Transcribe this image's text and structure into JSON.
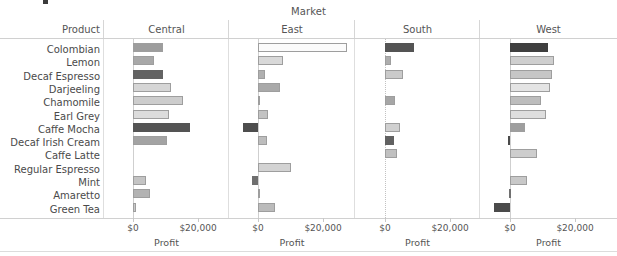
{
  "chart_data": {
    "type": "bar",
    "title": "Market",
    "row_field": "Product",
    "column_field": "Market",
    "xlabel": "Profit",
    "ylabel": "Product",
    "orientation": "horizontal",
    "grid": false,
    "legend": "none",
    "xlim": [
      -8000,
      30000
    ],
    "xticks": [
      0,
      20000
    ],
    "xticklabels": [
      "$0",
      "$20,000"
    ],
    "categories": [
      "Colombian",
      "Lemon",
      "Decaf Espresso",
      "Darjeeling",
      "Chamomile",
      "Earl Grey",
      "Caffe Mocha",
      "Decaf Irish Cream",
      "Caffe Latte",
      "Regular Espresso",
      "Mint",
      "Amaretto",
      "Green Tea"
    ],
    "panels": [
      {
        "name": "Central",
        "values": [
          9200,
          6400,
          9200,
          11700,
          15400,
          11000,
          17500,
          10500,
          0,
          0,
          4000,
          5200,
          800
        ],
        "colors": [
          "#9d9d9d",
          "#a8a8a8",
          "#636363",
          "#d6d6d6",
          "#cdcdcd",
          "#dcdcdc",
          "#545454",
          "#a3a3a3",
          null,
          null,
          "#c4c4c4",
          "#b3b3b3",
          "#c9c9c9"
        ]
      },
      {
        "name": "East",
        "values": [
          27400,
          7700,
          2200,
          6900,
          600,
          3200,
          -4600,
          2700,
          0,
          10300,
          -1700,
          700,
          5300
        ],
        "colors": [
          "#fbfbfb",
          "#d9d9d9",
          "#b0b0b0",
          "#a9a9a9",
          "#c9c9c9",
          "#c3c3c3",
          "#4d4d4d",
          "#bdbdbd",
          null,
          "#d3d3d3",
          "#6f6f6f",
          "#c7c7c7",
          "#bbbbbb"
        ]
      },
      {
        "name": "South",
        "values": [
          9000,
          1900,
          5400,
          0,
          3100,
          0,
          4700,
          2700,
          3700,
          0,
          0,
          0,
          0
        ],
        "colors": [
          "#545454",
          "#adadad",
          "#cacaca",
          null,
          "#a6a6a6",
          null,
          "#d0d0d0",
          "#616161",
          "#c0c0c0",
          null,
          null,
          null,
          null
        ]
      },
      {
        "name": "West",
        "values": [
          11800,
          13600,
          12800,
          12200,
          9400,
          11000,
          4600,
          -700,
          8200,
          0,
          5100,
          -400,
          -5000
        ],
        "colors": [
          "#3f3f3f",
          "#cfcfcf",
          "#c6c6c6",
          "#e4e4e4",
          "#bdbdbd",
          "#dedede",
          "#9e9e9e",
          "#4a4a4a",
          "#cdcdcd",
          null,
          "#c8c8c8",
          "#707070",
          "#4b4b4b"
        ]
      }
    ]
  },
  "geometry": {
    "panel_lefts": [
      104,
      229,
      355,
      480
    ],
    "panel_widths": [
      125,
      126,
      125,
      137
    ],
    "zero_offsets": [
      29,
      29,
      30,
      30
    ],
    "px_per_20k": 65,
    "row_pitch": 13.3,
    "row_top": 4,
    "bar_height": 9
  }
}
